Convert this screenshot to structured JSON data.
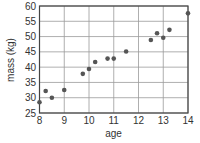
{
  "chart_data": {
    "type": "scatter",
    "title": "",
    "xlabel": "age",
    "ylabel": "mass (kg)",
    "xlim": [
      8,
      14
    ],
    "ylim": [
      25,
      60
    ],
    "x_ticks": [
      8,
      9,
      10,
      11,
      12,
      13,
      14
    ],
    "y_ticks": [
      25,
      30,
      35,
      40,
      45,
      50,
      55,
      60
    ],
    "grid": true,
    "legend": null,
    "colors": {
      "point": "#555555",
      "grid": "#9a9a9a",
      "frame": "#444444",
      "text": "#333333"
    },
    "series": [
      {
        "name": "mass vs age",
        "points": [
          {
            "x": 8.0,
            "y": 28.5
          },
          {
            "x": 8.25,
            "y": 32.2
          },
          {
            "x": 8.5,
            "y": 30.0
          },
          {
            "x": 9.0,
            "y": 32.5
          },
          {
            "x": 9.75,
            "y": 37.8
          },
          {
            "x": 10.0,
            "y": 39.4
          },
          {
            "x": 10.25,
            "y": 41.7
          },
          {
            "x": 10.75,
            "y": 42.8
          },
          {
            "x": 11.0,
            "y": 42.8
          },
          {
            "x": 11.5,
            "y": 45.1
          },
          {
            "x": 12.5,
            "y": 48.9
          },
          {
            "x": 12.75,
            "y": 51.1
          },
          {
            "x": 13.0,
            "y": 49.6
          },
          {
            "x": 13.25,
            "y": 52.2
          },
          {
            "x": 14.0,
            "y": 57.6
          }
        ]
      }
    ]
  }
}
